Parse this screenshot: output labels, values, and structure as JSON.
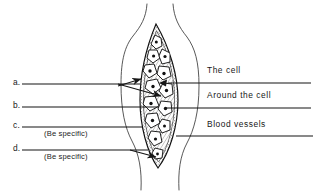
{
  "figure": {
    "kind": "labeled-anatomy-diagram",
    "background_color": "#ffffff",
    "ink_color": "#171717",
    "capsule_fill": "#f2f0ee",
    "stipple_color": "#2b2b2b"
  },
  "answer_blanks": [
    {
      "id": "a",
      "marker": "a.",
      "hint": ""
    },
    {
      "id": "b",
      "marker": "b.",
      "hint": ""
    },
    {
      "id": "c",
      "marker": "c.",
      "hint": "(Be specific)"
    },
    {
      "id": "d",
      "marker": "d.",
      "hint": "(Be specific)"
    }
  ],
  "callouts": [
    {
      "id": "the-cell",
      "label": "The cell"
    },
    {
      "id": "around-the-cell",
      "label": "Around the cell"
    },
    {
      "id": "blood-vessels",
      "label": "Blood vessels"
    }
  ]
}
